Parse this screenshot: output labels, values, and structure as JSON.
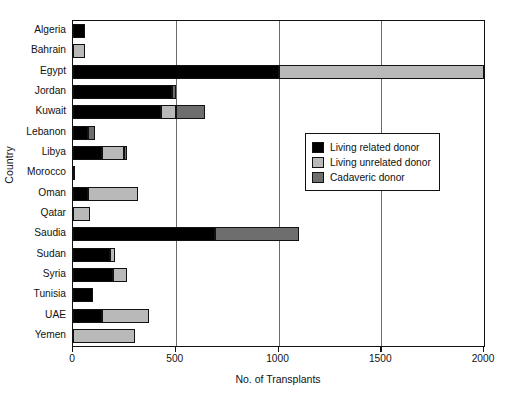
{
  "chart_data": {
    "type": "bar",
    "orientation": "horizontal",
    "stacked": true,
    "title": "",
    "xlabel": "No. of Transplants",
    "ylabel": "Country",
    "xlim": [
      0,
      2000
    ],
    "xticks": [
      0,
      500,
      1000,
      1500,
      2000
    ],
    "xtick_labels": [
      "0",
      "500",
      "1000",
      "1500",
      "2000"
    ],
    "grid": true,
    "grid_axis": "x",
    "legend_position": "center-right",
    "categories": [
      "Algeria",
      "Bahrain",
      "Egypt",
      "Jordan",
      "Kuwait",
      "Lebanon",
      "Libya",
      "Morocco",
      "Oman",
      "Qatar",
      "Saudia",
      "Sudan",
      "Syria",
      "Tunisia",
      "UAE",
      "Yemen"
    ],
    "series": [
      {
        "name": "Living related donor",
        "color": "#000000",
        "values": [
          60,
          0,
          1000,
          480,
          430,
          75,
          140,
          12,
          75,
          0,
          690,
          180,
          195,
          95,
          140,
          0
        ]
      },
      {
        "name": "Living unrelated donor",
        "color": "#b9b9b9",
        "values": [
          0,
          60,
          1000,
          0,
          70,
          0,
          110,
          0,
          240,
          85,
          0,
          25,
          70,
          0,
          230,
          300
        ]
      },
      {
        "name": "Cadaveric donor",
        "color": "#6e6e6e",
        "values": [
          0,
          0,
          0,
          20,
          140,
          30,
          15,
          0,
          0,
          0,
          410,
          0,
          0,
          0,
          0,
          0
        ]
      }
    ],
    "totals": [
      60,
      60,
      2000,
      500,
      640,
      105,
      265,
      12,
      315,
      85,
      1100,
      205,
      265,
      95,
      370,
      300
    ]
  },
  "legend": {
    "items": [
      {
        "label": "Living related donor",
        "swatch": "living-related"
      },
      {
        "label": "Living unrelated donor",
        "swatch": "living-unrelated"
      },
      {
        "label": "Cadaveric donor",
        "swatch": "cadaveric"
      }
    ]
  },
  "colors": {
    "living_related": "#000000",
    "living_unrelated": "#b9b9b9",
    "cadaveric": "#6e6e6e",
    "axis": "#111111",
    "gridline": "#6b6b6b",
    "background": "#ffffff"
  }
}
